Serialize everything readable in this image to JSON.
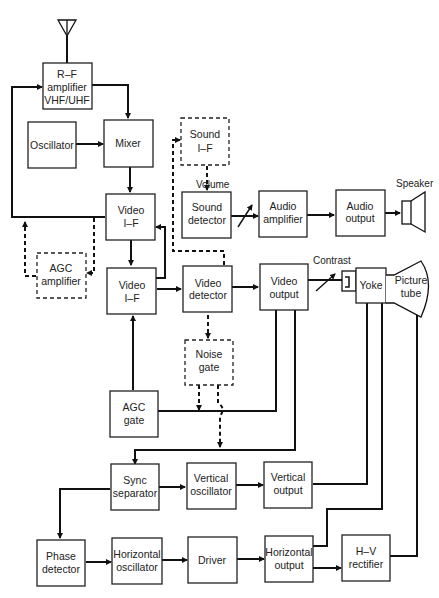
{
  "diagram": {
    "type": "block-diagram",
    "blocks": {
      "rf_amp": {
        "l1": "R–F",
        "l2": "amplifier",
        "l3": "VHF/UHF"
      },
      "oscillator": {
        "l1": "Oscillator"
      },
      "mixer": {
        "l1": "Mixer"
      },
      "sound_if": {
        "l1": "Sound",
        "l2": "I–F",
        "dashed": true
      },
      "video_if1": {
        "l1": "Video",
        "l2": "I–F"
      },
      "sound_det": {
        "l1": "Sound",
        "l2": "detector"
      },
      "audio_amp": {
        "l1": "Audio",
        "l2": "amplifier"
      },
      "audio_out": {
        "l1": "Audio",
        "l2": "output"
      },
      "agc_amp": {
        "l1": "AGC",
        "l2": "amplifier",
        "dashed": true
      },
      "video_if2": {
        "l1": "Video",
        "l2": "I–F"
      },
      "video_det": {
        "l1": "Video",
        "l2": "detector"
      },
      "video_out": {
        "l1": "Video",
        "l2": "output"
      },
      "yoke": {
        "l1": "Yoke"
      },
      "picture_tube": {
        "l1": "Picture",
        "l2": "tube"
      },
      "noise_gate": {
        "l1": "Noise",
        "l2": "gate",
        "dashed": true
      },
      "agc_gate": {
        "l1": "AGC",
        "l2": "gate"
      },
      "sync_sep": {
        "l1": "Sync",
        "l2": "separator"
      },
      "vert_osc": {
        "l1": "Vertical",
        "l2": "oscillator"
      },
      "vert_out": {
        "l1": "Vertical",
        "l2": "output"
      },
      "phase_det": {
        "l1": "Phase",
        "l2": "detector"
      },
      "horiz_osc": {
        "l1": "Horizontal",
        "l2": "oscillator"
      },
      "driver": {
        "l1": "Driver"
      },
      "horiz_out": {
        "l1": "Horizontal",
        "l2": "output"
      },
      "hv_rect": {
        "l1": "H–V",
        "l2": "rectifier"
      }
    },
    "annotations": {
      "volume": "Volume",
      "speaker": "Speaker",
      "contrast": "Contrast"
    }
  }
}
